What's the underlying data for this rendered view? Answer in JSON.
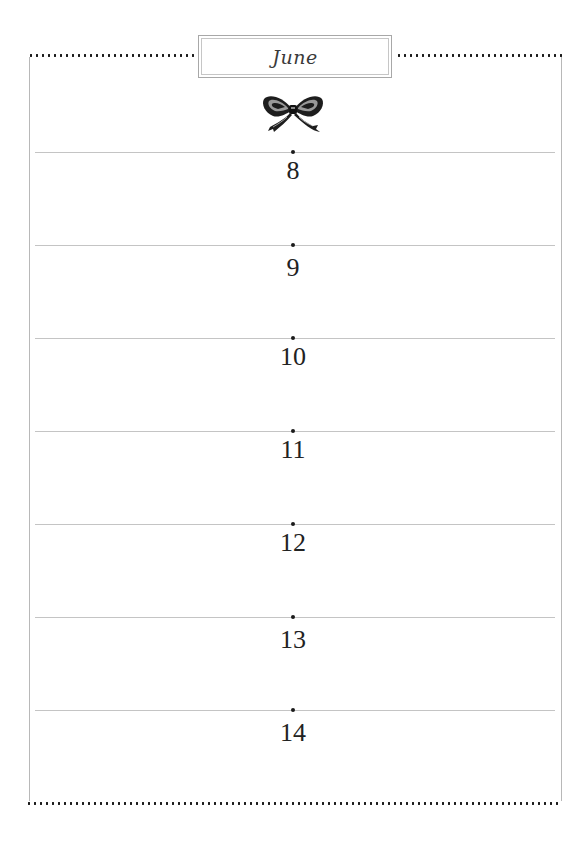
{
  "page": {
    "type": "weekly planner page",
    "background_color": "#ffffff",
    "rule_color": "#c4c4c4",
    "dot_color": "#1a1a1a"
  },
  "header": {
    "month_title": "June",
    "ornament": "bow-ribbon-icon"
  },
  "days": [
    {
      "number": "8"
    },
    {
      "number": "9"
    },
    {
      "number": "10"
    },
    {
      "number": "11"
    },
    {
      "number": "12"
    },
    {
      "number": "13"
    },
    {
      "number": "14"
    }
  ]
}
